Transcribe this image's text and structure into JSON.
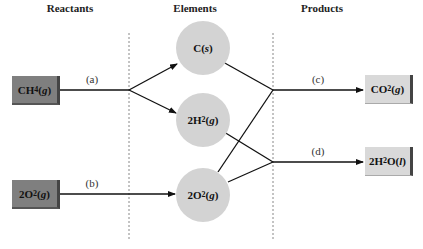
{
  "headings": {
    "reactants": "Reactants",
    "elements": "Elements",
    "products": "Products"
  },
  "reactants": [
    {
      "coef": "",
      "formula": "CH",
      "sub": "4",
      "state": "g"
    },
    {
      "coef": "2",
      "formula": "O",
      "sub": "2",
      "state": "g"
    }
  ],
  "elements": [
    {
      "coef": "",
      "formula": "C",
      "sub": "",
      "state": "s"
    },
    {
      "coef": "2",
      "formula": "H",
      "sub": "2",
      "state": "g"
    },
    {
      "coef": "2",
      "formula": "O",
      "sub": "2",
      "state": "g"
    }
  ],
  "products": [
    {
      "coef": "",
      "formula": "CO",
      "sub": "2",
      "state": "g",
      "rest": ""
    },
    {
      "coef": "2",
      "formula": "H",
      "sub": "2",
      "state": "l",
      "rest": "O"
    }
  ],
  "step_labels": {
    "a": "(a)",
    "b": "(b)",
    "c": "(c)",
    "d": "(d)"
  },
  "colors": {
    "reactant_box": "#7f7f7f",
    "product_box": "#d9d9d9",
    "element_circle": "#d3d3d3",
    "arrow": "#111111",
    "divider": "#888888"
  }
}
